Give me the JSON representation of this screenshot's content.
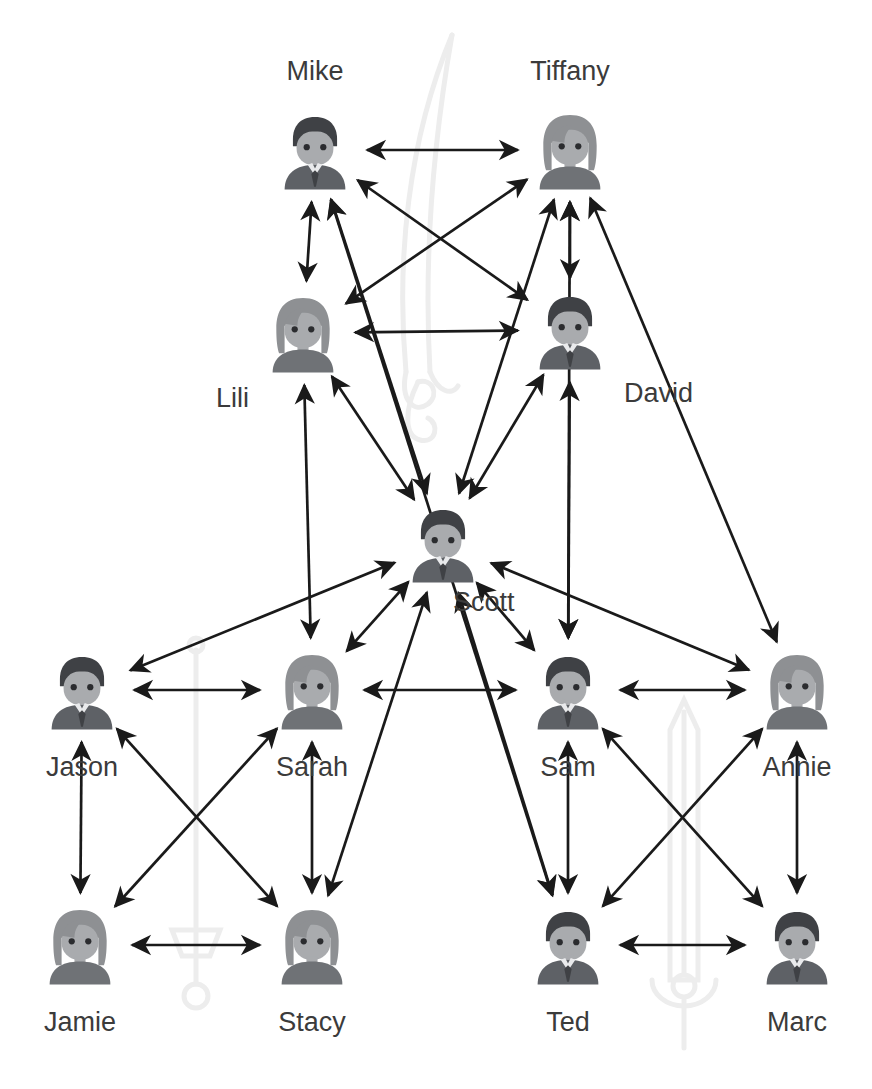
{
  "diagram": {
    "background_color": "#ffffff",
    "arrow_color": "#1a1a1a",
    "label_color": "#3b3b3b",
    "avatar_colors": {
      "male_hair": "#3f4145",
      "female_hair": "#8e9093",
      "face": "#a9abae",
      "male_body": "#5e6166",
      "female_body": "#6f7276",
      "shirt": "#e9eaec",
      "eye": "#2b2c2f"
    },
    "watermark_color": "#eeeeee"
  },
  "nodes": [
    {
      "id": "mike",
      "label": "Mike",
      "gender": "male",
      "x": 315,
      "y": 150,
      "label_pos": "above"
    },
    {
      "id": "tiffany",
      "label": "Tiffany",
      "gender": "female",
      "x": 570,
      "y": 150,
      "label_pos": "above"
    },
    {
      "id": "lili",
      "label": "Lili",
      "gender": "female",
      "x": 303,
      "y": 333,
      "label_pos": "bl"
    },
    {
      "id": "david",
      "label": "David",
      "gender": "male",
      "x": 570,
      "y": 330,
      "label_pos": "br"
    },
    {
      "id": "scott",
      "label": "Scott",
      "gender": "male",
      "x": 443,
      "y": 543,
      "label_pos": "inr"
    },
    {
      "id": "jason",
      "label": "Jason",
      "gender": "male",
      "x": 82,
      "y": 690,
      "label_pos": "below"
    },
    {
      "id": "sarah",
      "label": "Sarah",
      "gender": "female",
      "x": 312,
      "y": 690,
      "label_pos": "below"
    },
    {
      "id": "sam",
      "label": "Sam",
      "gender": "male",
      "x": 568,
      "y": 690,
      "label_pos": "below"
    },
    {
      "id": "annie",
      "label": "Annie",
      "gender": "female",
      "x": 797,
      "y": 690,
      "label_pos": "below"
    },
    {
      "id": "jamie",
      "label": "Jamie",
      "gender": "female",
      "x": 80,
      "y": 945,
      "label_pos": "below"
    },
    {
      "id": "stacy",
      "label": "Stacy",
      "gender": "female",
      "x": 312,
      "y": 945,
      "label_pos": "below"
    },
    {
      "id": "ted",
      "label": "Ted",
      "gender": "male",
      "x": 568,
      "y": 945,
      "label_pos": "below"
    },
    {
      "id": "marc",
      "label": "Marc",
      "gender": "male",
      "x": 797,
      "y": 945,
      "label_pos": "below"
    }
  ],
  "edges": [
    {
      "from": "mike",
      "to": "tiffany",
      "style": "double"
    },
    {
      "from": "mike",
      "to": "lili",
      "style": "double"
    },
    {
      "from": "tiffany",
      "to": "david",
      "style": "double"
    },
    {
      "from": "mike",
      "to": "david",
      "style": "double"
    },
    {
      "from": "tiffany",
      "to": "lili",
      "style": "double"
    },
    {
      "from": "lili",
      "to": "david",
      "style": "double"
    },
    {
      "from": "lili",
      "to": "scott",
      "style": "double"
    },
    {
      "from": "david",
      "to": "scott",
      "style": "double"
    },
    {
      "from": "mike",
      "to": "scott",
      "style": "double"
    },
    {
      "from": "tiffany",
      "to": "scott",
      "style": "double"
    },
    {
      "from": "lili",
      "to": "sarah",
      "style": "double"
    },
    {
      "from": "david",
      "to": "sam",
      "style": "double"
    },
    {
      "from": "tiffany",
      "to": "sam",
      "style": "double"
    },
    {
      "from": "mike",
      "to": "ted",
      "style": "double"
    },
    {
      "from": "tiffany",
      "to": "annie",
      "style": "double"
    },
    {
      "from": "scott",
      "to": "jason",
      "style": "double"
    },
    {
      "from": "scott",
      "to": "sarah",
      "style": "double"
    },
    {
      "from": "scott",
      "to": "sam",
      "style": "double"
    },
    {
      "from": "scott",
      "to": "annie",
      "style": "double"
    },
    {
      "from": "scott",
      "to": "stacy",
      "style": "double"
    },
    {
      "from": "scott",
      "to": "ted",
      "style": "double"
    },
    {
      "from": "jason",
      "to": "sarah",
      "style": "double"
    },
    {
      "from": "sam",
      "to": "annie",
      "style": "double"
    },
    {
      "from": "jason",
      "to": "jamie",
      "style": "double"
    },
    {
      "from": "sarah",
      "to": "stacy",
      "style": "double"
    },
    {
      "from": "sam",
      "to": "ted",
      "style": "double"
    },
    {
      "from": "annie",
      "to": "marc",
      "style": "double"
    },
    {
      "from": "jamie",
      "to": "stacy",
      "style": "double"
    },
    {
      "from": "ted",
      "to": "marc",
      "style": "double"
    },
    {
      "from": "jason",
      "to": "stacy",
      "style": "double"
    },
    {
      "from": "jamie",
      "to": "sarah",
      "style": "double"
    },
    {
      "from": "sam",
      "to": "marc",
      "style": "double"
    },
    {
      "from": "annie",
      "to": "ted",
      "style": "double"
    },
    {
      "from": "sarah",
      "to": "sam",
      "style": "double"
    }
  ],
  "watermarks": [
    {
      "id": "saber",
      "kind": "curved-saber",
      "x": 452,
      "y": 215,
      "w": 150,
      "h": 400,
      "rot": 0
    },
    {
      "id": "rapier",
      "kind": "straight-sword",
      "x": 196,
      "y": 815,
      "w": 70,
      "h": 330,
      "rot": 180
    },
    {
      "id": "broadsword",
      "kind": "broad-sword",
      "x": 684,
      "y": 830,
      "w": 80,
      "h": 310,
      "rot": 0
    }
  ]
}
